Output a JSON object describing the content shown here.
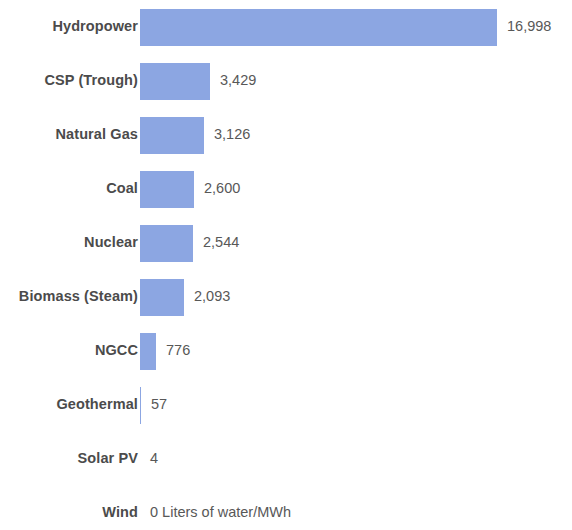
{
  "chart_data": {
    "type": "bar",
    "orientation": "horizontal",
    "title": "",
    "subtitle": "",
    "xlabel": "",
    "ylabel": "",
    "unit_text": "Liters of water/MWh",
    "grid": false,
    "legend": false,
    "axis_visible": false,
    "xlim": [
      0,
      16998
    ],
    "bar_color": "#8ca6e2",
    "label_color": "#4b4b4b",
    "value_color": "#585858",
    "background": "#ffffff",
    "categories": [
      "Hydropower",
      "CSP (Trough)",
      "Natural Gas",
      "Coal",
      "Nuclear",
      "Biomass (Steam)",
      "NGCC",
      "Geothermal",
      "Solar PV",
      "Wind"
    ],
    "values": [
      16998,
      3429,
      3126,
      2600,
      2544,
      2093,
      776,
      57,
      4,
      0
    ],
    "value_labels": [
      "16,998",
      "3,429",
      "3,126",
      "2,600",
      "2,544",
      "2,093",
      "776",
      "57",
      "4",
      "0 Liters of water/MWh"
    ]
  },
  "rows": [
    {
      "label": "Hydropower",
      "value": 16998,
      "value_label": "16,998",
      "bar_px": 357,
      "top": 0
    },
    {
      "label": "CSP (Trough)",
      "value": 3429,
      "value_label": "3,429",
      "bar_px": 70,
      "top": 54
    },
    {
      "label": "Natural Gas",
      "value": 3126,
      "value_label": "3,126",
      "bar_px": 64,
      "top": 108
    },
    {
      "label": "Coal",
      "value": 2600,
      "value_label": "2,600",
      "bar_px": 54,
      "top": 162
    },
    {
      "label": "Nuclear",
      "value": 2544,
      "value_label": "2,544",
      "bar_px": 53,
      "top": 216
    },
    {
      "label": "Biomass (Steam)",
      "value": 2093,
      "value_label": "2,093",
      "bar_px": 44,
      "top": 270
    },
    {
      "label": "NGCC",
      "value": 776,
      "value_label": "776",
      "bar_px": 16,
      "top": 324
    },
    {
      "label": "Geothermal",
      "value": 57,
      "value_label": "57",
      "bar_px": 1,
      "top": 378
    },
    {
      "label": "Solar PV",
      "value": 4,
      "value_label": "4",
      "bar_px": 0,
      "top": 432
    },
    {
      "label": "Wind",
      "value": 0,
      "value_label": "0 Liters of water/MWh",
      "bar_px": 0,
      "top": 486
    }
  ]
}
